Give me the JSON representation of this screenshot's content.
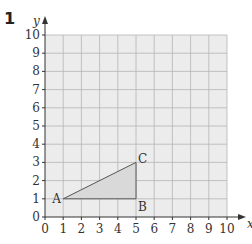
{
  "question_number": "1",
  "diagram": {
    "x_axis_label": "x",
    "y_axis_label": "y",
    "x_ticks": [
      "0",
      "1",
      "2",
      "3",
      "4",
      "5",
      "6",
      "7",
      "8",
      "9",
      "10"
    ],
    "y_ticks": [
      "0",
      "1",
      "2",
      "3",
      "4",
      "5",
      "6",
      "7",
      "8",
      "9",
      "10"
    ],
    "x_range": [
      0,
      10
    ],
    "y_range": [
      0,
      10
    ],
    "grid": true,
    "grid_background": "#ececec",
    "shape": {
      "type": "triangle",
      "fill": "#d9d9d9",
      "stroke": "#555555",
      "vertices": [
        {
          "label": "A",
          "x": 1,
          "y": 1
        },
        {
          "label": "B",
          "x": 5,
          "y": 1
        },
        {
          "label": "C",
          "x": 5,
          "y": 3
        }
      ]
    }
  }
}
